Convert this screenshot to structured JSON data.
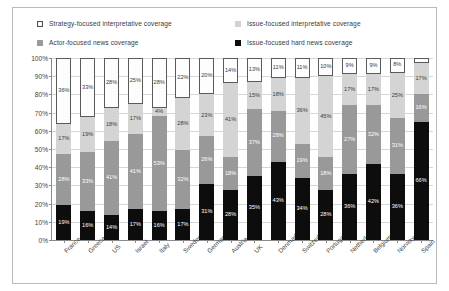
{
  "legend": {
    "items": [
      {
        "label": "Strategy-focused interpretative coverage",
        "key": "strategy",
        "color": "#ffffff",
        "border": "#4a4a4a"
      },
      {
        "label": "Issue-focused interpretative coverage",
        "key": "issue_interpretative",
        "color": "#d2d2d2"
      },
      {
        "label": "Actor-focused news coverage",
        "key": "actor",
        "color": "#9a9a9a"
      },
      {
        "label": "Issue-focused hard news coverage",
        "key": "hard",
        "color": "#0d0d0d"
      }
    ]
  },
  "axis": {
    "y_ticks": [
      "100%",
      "90%",
      "80%",
      "70%",
      "60%",
      "50%",
      "40%",
      "30%",
      "20%",
      "10%",
      "0%"
    ]
  },
  "chart_data": {
    "type": "bar",
    "stacked": true,
    "normalized": true,
    "title": "",
    "xlabel": "",
    "ylabel": "",
    "ylim": [
      0,
      100
    ],
    "grid": true,
    "legend_position": "top",
    "categories": [
      "France",
      "Greece",
      "US",
      "Israel",
      "Italy",
      "Sweden",
      "Germany",
      "Austria",
      "UK",
      "Denmark",
      "Switzerland",
      "Portugal",
      "Netherlands",
      "Belgium",
      "Norway",
      "Spain"
    ],
    "series": [
      {
        "name": "Strategy-focused interpretative coverage",
        "color": "#ffffff",
        "values": [
          36,
          33,
          28,
          25,
          28,
          22,
          20,
          14,
          13,
          11,
          11,
          10,
          9,
          9,
          8,
          3
        ],
        "labels": [
          "36%",
          "33%",
          "28%",
          "25%",
          "28%",
          "22%",
          "20%",
          "14%",
          "13%",
          "11%",
          "11%",
          "10%",
          "9%",
          "9%",
          "8%",
          "3%"
        ]
      },
      {
        "name": "Issue-focused interpretative coverage",
        "color": "#d2d2d2",
        "values": [
          17,
          19,
          18,
          17,
          4,
          28,
          23,
          41,
          15,
          18,
          36,
          45,
          17,
          17,
          25,
          17
        ],
        "labels": [
          "17%",
          "19%",
          "18%",
          "17%",
          "4%",
          "28%",
          "23%",
          "41%",
          "15%",
          "18%",
          "36%",
          "45%",
          "17%",
          "17%",
          "25%",
          "17%"
        ]
      },
      {
        "name": "Actor-focused news coverage",
        "color": "#999999",
        "values": [
          28,
          33,
          41,
          41,
          53,
          32,
          26,
          18,
          37,
          28,
          19,
          18,
          38,
          32,
          31,
          16
        ],
        "labels": [
          "28%",
          "33%",
          "41%",
          "41%",
          "53%",
          "32%",
          "26%",
          "18%",
          "37%",
          "28%",
          "19%",
          "18%",
          "27%",
          "32%",
          "31%",
          "16%"
        ]
      },
      {
        "name": "Issue-focused hard news coverage",
        "color": "#0d0d0d",
        "values": [
          19,
          16,
          14,
          17,
          16,
          17,
          31,
          28,
          35,
          43,
          34,
          28,
          36,
          42,
          36,
          66
        ],
        "labels": [
          "19%",
          "16%",
          "14%",
          "17%",
          "16%",
          "17%",
          "31%",
          "28%",
          "35%",
          "43%",
          "34%",
          "28%",
          "36%",
          "42%",
          "36%",
          "66%"
        ]
      }
    ]
  }
}
